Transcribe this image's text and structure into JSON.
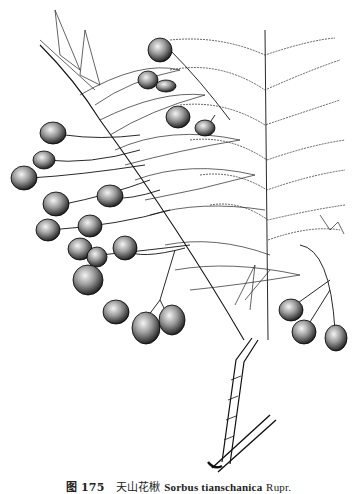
{
  "figure": {
    "style": "black ink botanical line drawing",
    "elements": [
      "pinnate-leaves",
      "fruit-clusters",
      "woody-stem",
      "cut-branch-base"
    ]
  },
  "caption": {
    "figure_label": "图 175",
    "chinese_name": "天山花楸",
    "scientific_name": "Sorbus tianschanica",
    "author": "Rupr."
  }
}
